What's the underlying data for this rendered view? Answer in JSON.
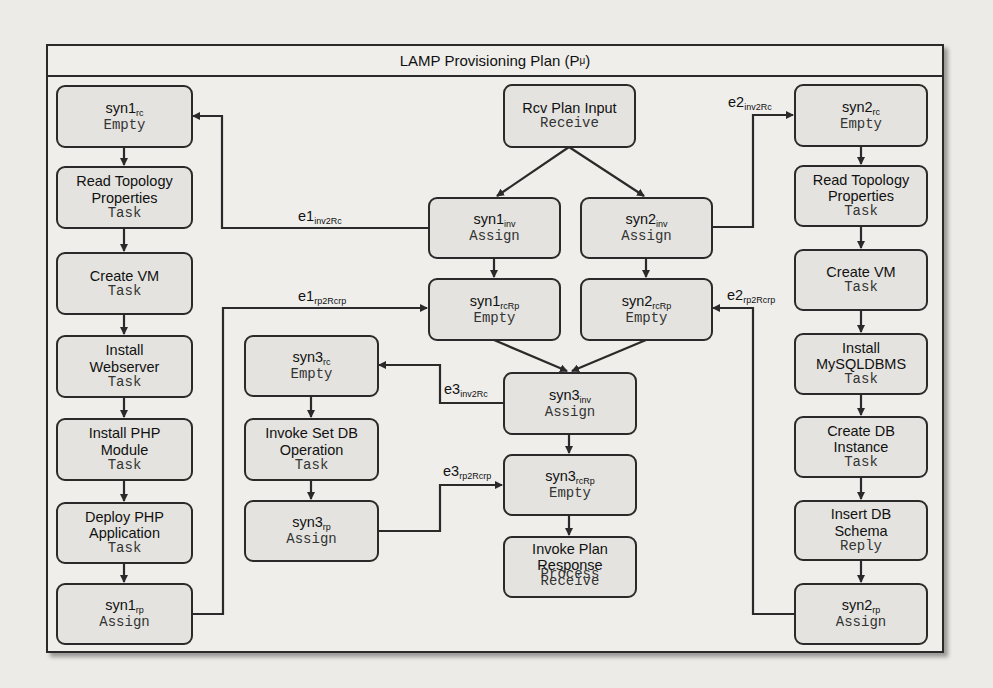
{
  "diagram": {
    "title": "LAMP Provisioning Plan (P",
    "title_sub": "μ",
    "title_suffix": ")",
    "colors": {
      "line": "#2a2a2a",
      "node_fill": "#e4e3df",
      "background": "#efeeeb"
    },
    "nodes": {
      "syn1_rc": {
        "name": "syn1",
        "sub": "rc",
        "kind": "Empty"
      },
      "read_topology_1": {
        "name": "Read Topology Properties",
        "kind": "Task"
      },
      "create_vm_1": {
        "name": "Create VM",
        "kind": "Task"
      },
      "install_webserver": {
        "name": "Install Webserver",
        "kind": "Task"
      },
      "install_php_module": {
        "name": "Install PHP Module",
        "kind": "Task"
      },
      "deploy_php_app": {
        "name": "Deploy PHP Application",
        "kind": "Task"
      },
      "syn1_rp": {
        "name": "syn1",
        "sub": "rp",
        "kind": "Assign"
      },
      "rcv_plan_input": {
        "name": "Rcv Plan Input",
        "kind": "Receive"
      },
      "syn1_inv": {
        "name": "syn1",
        "sub": "inv",
        "kind": "Assign"
      },
      "syn2_inv": {
        "name": "syn2",
        "sub": "inv",
        "kind": "Assign"
      },
      "syn1_rcRp": {
        "name": "syn1",
        "sub": "rcRp",
        "kind": "Empty"
      },
      "syn2_rcRp": {
        "name": "syn2",
        "sub": "rcRp",
        "kind": "Empty"
      },
      "syn3_rc": {
        "name": "syn3",
        "sub": "rc",
        "kind": "Empty"
      },
      "invoke_set_db": {
        "name": "Invoke Set DB Operation",
        "kind": "Task"
      },
      "syn3_rp": {
        "name": "syn3",
        "sub": "rp",
        "kind": "Assign"
      },
      "syn3_inv": {
        "name": "syn3",
        "sub": "inv",
        "kind": "Assign"
      },
      "syn3_rcRp": {
        "name": "syn3",
        "sub": "rcRp",
        "kind": "Empty"
      },
      "invoke_plan_response": {
        "name": "Invoke Plan Response",
        "kind": "Process",
        "kind2": "Receive"
      },
      "syn2_rc": {
        "name": "syn2",
        "sub": "rc",
        "kind": "Empty"
      },
      "read_topology_2": {
        "name": "Read Topology Properties",
        "kind": "Task"
      },
      "create_vm_2": {
        "name": "Create VM",
        "kind": "Task"
      },
      "install_mysql": {
        "name": "Install MySQLDBMS",
        "kind": "Task"
      },
      "create_db_instance": {
        "name": "Create DB Instance",
        "kind": "Task"
      },
      "insert_db_schema": {
        "name": "Insert DB Schema",
        "kind": "Reply"
      },
      "syn2_rp": {
        "name": "syn2",
        "sub": "rp",
        "kind": "Assign"
      }
    },
    "edge_labels": {
      "e1_inv2Rc": {
        "name": "e1",
        "sub": "inv2Rc"
      },
      "e1_rp2Rcrp": {
        "name": "e1",
        "sub": "rp2Rcrp"
      },
      "e2_inv2Rc": {
        "name": "e2",
        "sub": "inv2Rc"
      },
      "e2_rp2Rcrp": {
        "name": "e2",
        "sub": "rp2Rcrp"
      },
      "e3_inv2Rc": {
        "name": "e3",
        "sub": "inv2Rc"
      },
      "e3_rp2Rcrp": {
        "name": "e3",
        "sub": "rp2Rcrp"
      }
    }
  }
}
